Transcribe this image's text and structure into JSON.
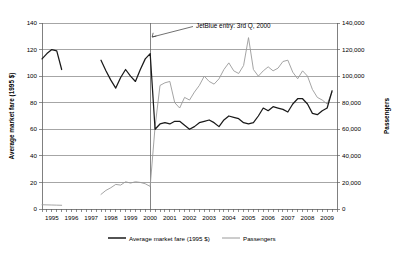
{
  "chart_data": {
    "type": "line",
    "title": "",
    "xlabel": "",
    "ylabel": "Average market fare (1995 $)",
    "y2label": "Passengers",
    "grid": true,
    "legend_position": "bottom",
    "xlim": [
      1995.0,
      2010.0
    ],
    "ylim": [
      0,
      140
    ],
    "y2lim": [
      0,
      140000
    ],
    "y_ticks": [
      0,
      20,
      40,
      60,
      80,
      100,
      120,
      140
    ],
    "y_tick_labels": [
      "0",
      "20",
      "40",
      "60",
      "80",
      "100",
      "120",
      "140"
    ],
    "y2_ticks": [
      0,
      20000,
      40000,
      60000,
      80000,
      100000,
      120000,
      140000
    ],
    "y2_tick_labels": [
      "0",
      "20,000",
      "40,000",
      "60,000",
      "80,000",
      "100,000",
      "120,000",
      "140,000"
    ],
    "x_tick_labels": [
      "1995",
      "1996",
      "1997",
      "1998",
      "1999",
      "2000",
      "2001",
      "2002",
      "2003",
      "2004",
      "2005",
      "2006",
      "2007",
      "2008",
      "2009"
    ],
    "x_minor_ticks_per_year": 4,
    "annotations": [
      {
        "text": "JetBlue entry: 3rd Q, 2000",
        "x": 2000.5,
        "type": "vertical-line-with-arrow-label"
      }
    ],
    "series": [
      {
        "name": "Average market fare (1995 $)",
        "axis": "left",
        "color": "#1a1a1a",
        "x": [
          1995.0,
          1995.25,
          1995.5,
          1995.75,
          1996.0,
          1998.0,
          1998.25,
          1998.5,
          1998.75,
          1999.0,
          1999.25,
          1999.5,
          1999.75,
          2000.0,
          2000.25,
          2000.5,
          2000.75,
          2001.0,
          2001.25,
          2001.5,
          2001.75,
          2002.0,
          2002.25,
          2002.5,
          2002.75,
          2003.0,
          2003.25,
          2003.5,
          2003.75,
          2004.0,
          2004.25,
          2004.5,
          2004.75,
          2005.0,
          2005.25,
          2005.5,
          2005.75,
          2006.0,
          2006.25,
          2006.5,
          2006.75,
          2007.0,
          2007.25,
          2007.5,
          2007.75,
          2008.0,
          2008.25,
          2008.5,
          2008.75,
          2009.0,
          2009.25,
          2009.5,
          2009.75
        ],
        "values": [
          113,
          117,
          120,
          119,
          105,
          112,
          104,
          97,
          91,
          99,
          105,
          100,
          96,
          105,
          113,
          117,
          60,
          64,
          65,
          64,
          66,
          66,
          63,
          60,
          62,
          65,
          66,
          67,
          65,
          62,
          67,
          70,
          69,
          68,
          65,
          64,
          65,
          70,
          76,
          74,
          77,
          76,
          75,
          73,
          79,
          83,
          83,
          79,
          72,
          71,
          74,
          76,
          89
        ]
      },
      {
        "name": "Passengers",
        "axis": "right",
        "color": "#9a9a9a",
        "x": [
          1995.0,
          1995.25,
          1995.5,
          1995.75,
          1996.0,
          1998.0,
          1998.25,
          1998.5,
          1998.75,
          1999.0,
          1999.25,
          1999.5,
          1999.75,
          2000.0,
          2000.25,
          2000.5,
          2000.75,
          2001.0,
          2001.25,
          2001.5,
          2001.75,
          2002.0,
          2002.25,
          2002.5,
          2002.75,
          2003.0,
          2003.25,
          2003.5,
          2003.75,
          2004.0,
          2004.25,
          2004.5,
          2004.75,
          2005.0,
          2005.25,
          2005.5,
          2005.75,
          2006.0,
          2006.25,
          2006.5,
          2006.75,
          2007.0,
          2007.25,
          2007.5,
          2007.75,
          2008.0,
          2008.25,
          2008.5,
          2008.75,
          2009.0,
          2009.25,
          2009.5,
          2009.75
        ],
        "values": [
          3200,
          3100,
          3000,
          2900,
          2800,
          11000,
          14000,
          16000,
          18500,
          18000,
          20500,
          19500,
          20500,
          20000,
          19000,
          17000,
          62000,
          93000,
          95000,
          96000,
          80000,
          76000,
          84000,
          82000,
          88000,
          93000,
          100000,
          96000,
          94000,
          98000,
          105000,
          110000,
          104000,
          102000,
          108000,
          129000,
          105000,
          100000,
          104000,
          107000,
          104000,
          106000,
          111000,
          112000,
          103000,
          98000,
          104000,
          100000,
          90000,
          84000,
          82000,
          79000,
          88000
        ]
      }
    ],
    "legend": [
      {
        "label": "Average market fare (1995 $)",
        "color": "#1a1a1a",
        "line_width": "thick"
      },
      {
        "label": "Passengers",
        "color": "#9a9a9a",
        "line_width": "thin"
      }
    ]
  }
}
